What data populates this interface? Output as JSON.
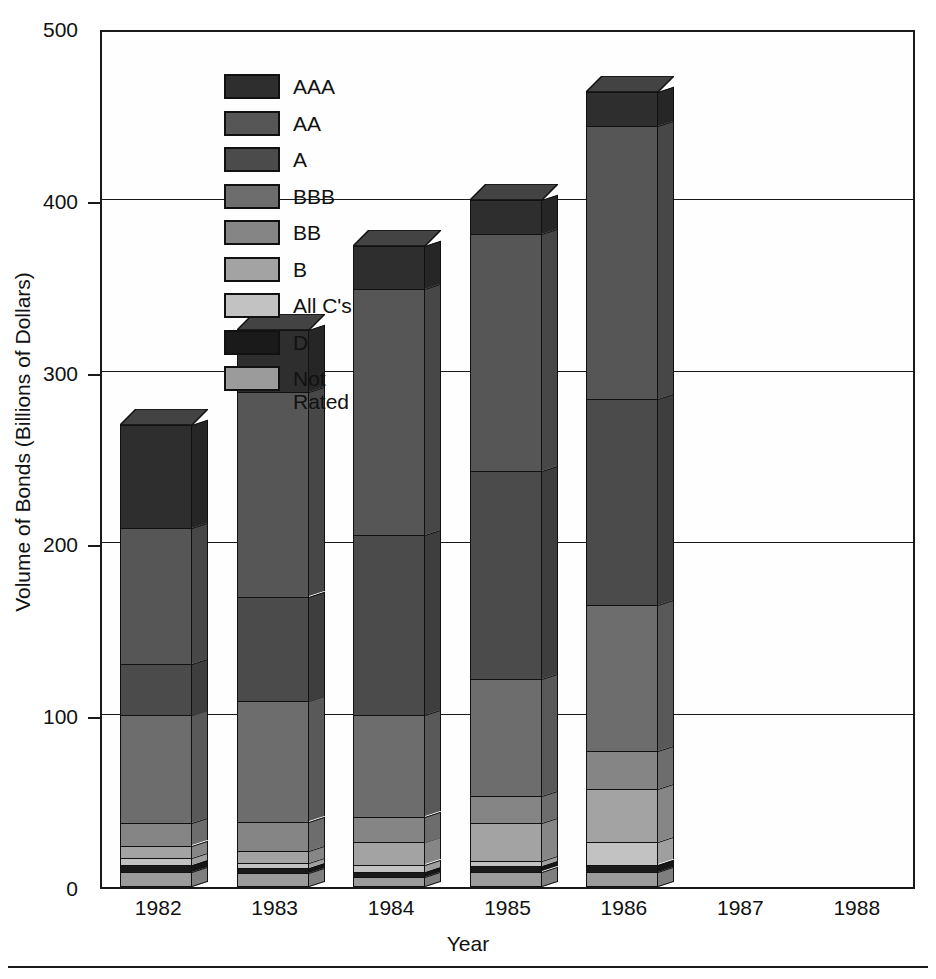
{
  "chart_data": {
    "type": "bar",
    "stacked": true,
    "title": "",
    "xlabel": "Year",
    "ylabel": "Volume of Bonds (Billions of Dollars)",
    "ylim": [
      0,
      500
    ],
    "yticks": [
      0,
      100,
      200,
      300,
      400,
      500
    ],
    "ytick_labels": [
      "0",
      "100",
      "200",
      "300",
      "400",
      "500"
    ],
    "grid": true,
    "legend_position": "upper-left-inside",
    "categories": [
      "1982",
      "1983",
      "1984",
      "1985",
      "1986",
      "1987",
      "1988"
    ],
    "series": [
      {
        "name": "AAA",
        "color": "#2e2e2e",
        "values": [
          60,
          36,
          25,
          20,
          20,
          null,
          null
        ]
      },
      {
        "name": "AA",
        "color": "#565656",
        "values": [
          79,
          119,
          143,
          138,
          159,
          null,
          null
        ]
      },
      {
        "name": "A",
        "color": "#4b4b4b",
        "values": [
          30,
          61,
          105,
          121,
          120,
          null,
          null
        ]
      },
      {
        "name": "BBB",
        "color": "#6d6d6d",
        "values": [
          63,
          70,
          59,
          68,
          85,
          null,
          null
        ]
      },
      {
        "name": "BB",
        "color": "#858585",
        "values": [
          13,
          17,
          15,
          16,
          22,
          null,
          null
        ]
      },
      {
        "name": "B",
        "color": "#a3a3a3",
        "values": [
          7,
          7,
          13,
          22,
          31,
          null,
          null
        ]
      },
      {
        "name": "All C's",
        "color": "#c2c2c2",
        "values": [
          4,
          3,
          4,
          3,
          13,
          null,
          null
        ]
      },
      {
        "name": "D",
        "color": "#1a1a1a",
        "values": [
          4,
          3,
          3,
          3,
          4,
          null,
          null
        ]
      },
      {
        "name": "Not Rated",
        "color": "#9b9b9b",
        "values": [
          9,
          8,
          6,
          9,
          9,
          null,
          null
        ]
      }
    ],
    "totals": [
      269,
      324,
      373,
      400,
      463,
      null,
      null
    ]
  },
  "legend": {
    "items": [
      {
        "label": "AAA",
        "color": "#2e2e2e"
      },
      {
        "label": "AA",
        "color": "#565656"
      },
      {
        "label": "A",
        "color": "#4b4b4b"
      },
      {
        "label": "BBB",
        "color": "#6d6d6d"
      },
      {
        "label": "BB",
        "color": "#858585"
      },
      {
        "label": "B",
        "color": "#a3a3a3"
      },
      {
        "label": "All C's",
        "color": "#c2c2c2"
      },
      {
        "label": "D",
        "color": "#1a1a1a"
      },
      {
        "label": "Not\nRated",
        "color": "#9b9b9b"
      }
    ]
  },
  "axes": {
    "y_title": "Volume of Bonds (Billions of Dollars)",
    "x_title": "Year"
  },
  "colors": {
    "axis": "#1a1a1a",
    "background": "#ffffff",
    "plot_background": "#fefefe",
    "outline": "#111111"
  }
}
